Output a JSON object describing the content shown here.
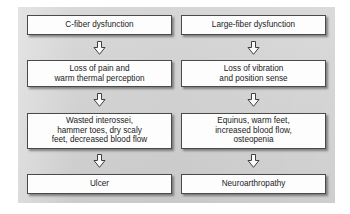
{
  "diagram": {
    "type": "flowchart",
    "title": "",
    "background_color": "#d2d2d2",
    "node_fill_color": "#fdfdfd",
    "node_border_color": "#4a4a4a",
    "columns": [
      {
        "id": "c-fiber-column",
        "nodes": [
          {
            "id": "c-fiber-dysfunction",
            "label": "C-fiber dysfunction",
            "lines": 1
          },
          {
            "id": "loss-of-pain",
            "label": "Loss of pain and\nwarm thermal perception",
            "lines": 2
          },
          {
            "id": "wasted-interossei",
            "label": "Wasted interossei,\nhammer toes, dry scaly\nfeet, decreased blood flow",
            "lines": 3
          },
          {
            "id": "ulcer",
            "label": "Ulcer",
            "lines": 1
          }
        ],
        "connector_icons": [
          "down-block-arrow-icon",
          "down-block-arrow-icon",
          "down-block-arrow-icon"
        ]
      },
      {
        "id": "large-fiber-column",
        "nodes": [
          {
            "id": "large-fiber-dysfunction",
            "label": "Large-fiber dysfunction",
            "lines": 1
          },
          {
            "id": "loss-of-vibration",
            "label": "Loss of vibration\nand position sense",
            "lines": 2
          },
          {
            "id": "equinus",
            "label": "Equinus, warm feet,\nincreased blood flow,\nosteopenia",
            "lines": 3
          },
          {
            "id": "neuroarthropathy",
            "label": "Neuroarthropathy",
            "lines": 1
          }
        ],
        "connector_icons": [
          "down-block-arrow-icon",
          "down-block-arrow-icon",
          "down-block-arrow-icon"
        ]
      }
    ]
  }
}
